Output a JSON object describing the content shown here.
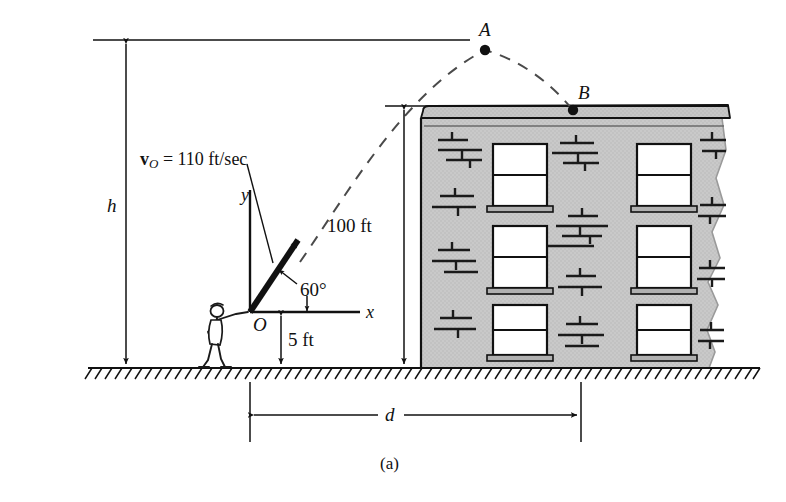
{
  "figure": {
    "caption": "(a)",
    "type": "projectile-motion-diagram",
    "points": [
      {
        "name": "point-a",
        "label": "A",
        "x": 485,
        "y": 50,
        "description": "apex of trajectory"
      },
      {
        "name": "point-b",
        "label": "B",
        "x": 573,
        "y": 110,
        "description": "landing point on building roof"
      },
      {
        "name": "origin",
        "label": "O",
        "x": 250,
        "y": 312,
        "description": "launch origin at thrower's hand"
      }
    ],
    "labels": {
      "velocity_bold": "v",
      "velocity_sub": "O",
      "velocity_rest": " = 110 ft/sec",
      "velocity_full": "v_O = 110 ft/sec",
      "angle": "60°",
      "axis_x": "x",
      "axis_y": "y",
      "origin": "O",
      "height_launch": "5 ft",
      "height_building": "100 ft",
      "height_apex": "h",
      "distance": "d",
      "point_a": "A",
      "point_b": "B"
    },
    "values": {
      "initial_speed": 110,
      "speed_units": "ft/sec",
      "launch_angle_deg": 60,
      "launch_height_ft": 5,
      "building_height_ft": 100,
      "apex_height_symbol": "h",
      "distance_symbol": "d"
    },
    "colors": {
      "ink": "#111111",
      "wall": "#c9c9c9",
      "wall_shade": "#bdbdbd",
      "roof_cap": "#c4c4c4",
      "window": "#ffffff",
      "background": "#ffffff"
    }
  }
}
